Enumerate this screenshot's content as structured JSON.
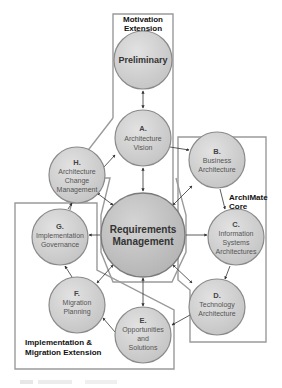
{
  "diagram": {
    "regions": {
      "motivation": {
        "label_line1": "Motivation",
        "label_line2": "Extension"
      },
      "core": {
        "label_line1": "ArchiMate",
        "label_line2": "Core"
      },
      "implementation": {
        "label_line1": "Implementation &",
        "label_line2": "Migration Extension"
      }
    },
    "nodes": {
      "preliminary": {
        "title": "Preliminary"
      },
      "a": {
        "letter": "A.",
        "line1": "Architecture",
        "line2": "Vision"
      },
      "b": {
        "letter": "B.",
        "line1": "Business",
        "line2": "Architecture"
      },
      "c": {
        "letter": "C.",
        "line1": "Information",
        "line2": "Systems",
        "line3": "Architectures"
      },
      "d": {
        "letter": "D.",
        "line1": "Technology",
        "line2": "Architecture"
      },
      "e": {
        "letter": "E.",
        "line1": "Opportunities",
        "line2": "and",
        "line3": "Solutions"
      },
      "f": {
        "letter": "F.",
        "line1": "Migration",
        "line2": "Planning"
      },
      "g": {
        "letter": "G.",
        "line1": "Implementation",
        "line2": "Governance"
      },
      "h": {
        "letter": "H.",
        "line1": "Architecture",
        "line2": "Change",
        "line3": "Management"
      },
      "requirements": {
        "line1": "Requirements",
        "line2": "Management"
      }
    },
    "colors": {
      "circle_fill": "#cfcfcf",
      "circle_stroke": "#8a8a8a",
      "region_stroke": "#9a9a9a",
      "arrow": "#333333"
    }
  }
}
